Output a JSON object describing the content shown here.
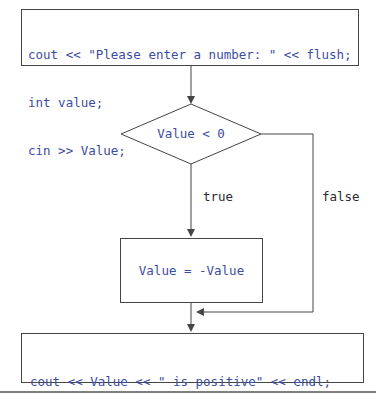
{
  "flowchart": {
    "top_box": {
      "lines": [
        "cout << \"Please enter a number: \" << flush;",
        "int value;",
        "cin >> Value;"
      ]
    },
    "decision": {
      "condition": "Value < 0",
      "true_label": "true",
      "false_label": "false"
    },
    "process_box": {
      "text": "Value = -Value"
    },
    "bottom_box": {
      "lines": [
        "cout << Value << \" is positive\" << endl;",
        "return 0;"
      ]
    }
  },
  "colors": {
    "code_text": "#3b4da3",
    "shape_stroke": "#454545",
    "branch_label_text": "#2b2b2b",
    "page_rule": "#7f7f7f",
    "background": "#ffffff"
  }
}
